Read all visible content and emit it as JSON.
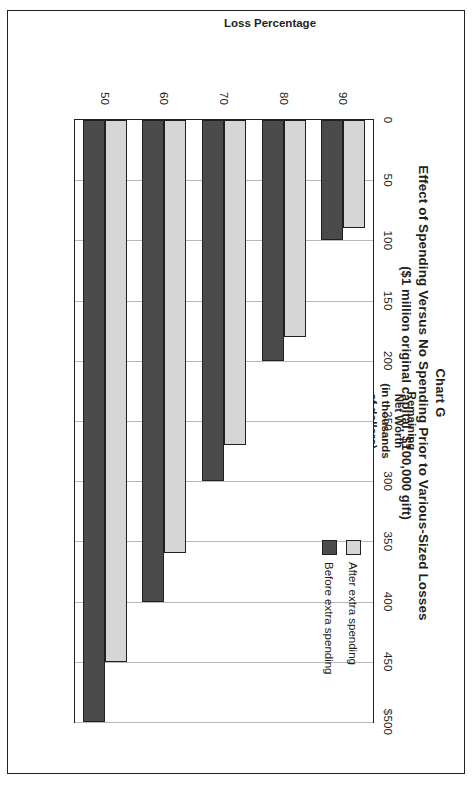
{
  "figure": {
    "chart_label": "Chart G",
    "title": "Effect of Spending Versus No Spending Prior to Various-Sized Losses",
    "subtitle": "($1 million original capital, $100,000 gift)"
  },
  "axes": {
    "value_axis_title": "Remaining\nNet Worth\n(in thousands\nof dollars)",
    "category_axis_title": "Loss Percentage"
  },
  "legend": {
    "items": [
      {
        "label": "After extra spending",
        "color": "#d6d6d6"
      },
      {
        "label": "Before extra spending",
        "color": "#4b4b4b"
      }
    ]
  },
  "chart_data": {
    "type": "bar",
    "orientation": "horizontal",
    "title": "Effect of Spending Versus No Spending Prior to Various-Sized Losses",
    "subtitle": "($1 million original capital, $100,000 gift)",
    "xlabel": "Remaining Net Worth (in thousands of dollars)",
    "ylabel": "Loss Percentage",
    "categories": [
      "90",
      "80",
      "70",
      "60",
      "50"
    ],
    "tick_labels": [
      "0",
      "50",
      "100",
      "150",
      "200",
      "250",
      "300",
      "350",
      "400",
      "450",
      "$500"
    ],
    "tick_values": [
      0,
      50,
      100,
      150,
      200,
      250,
      300,
      350,
      400,
      450,
      500
    ],
    "xlim": [
      0,
      500
    ],
    "grid": true,
    "legend_position": "inside-upper-right",
    "series": [
      {
        "name": "Before extra spending",
        "color": "#4b4b4b",
        "values": [
          100,
          200,
          300,
          400,
          500
        ]
      },
      {
        "name": "After extra spending",
        "color": "#d6d6d6",
        "values": [
          90,
          180,
          270,
          360,
          450
        ]
      }
    ]
  }
}
